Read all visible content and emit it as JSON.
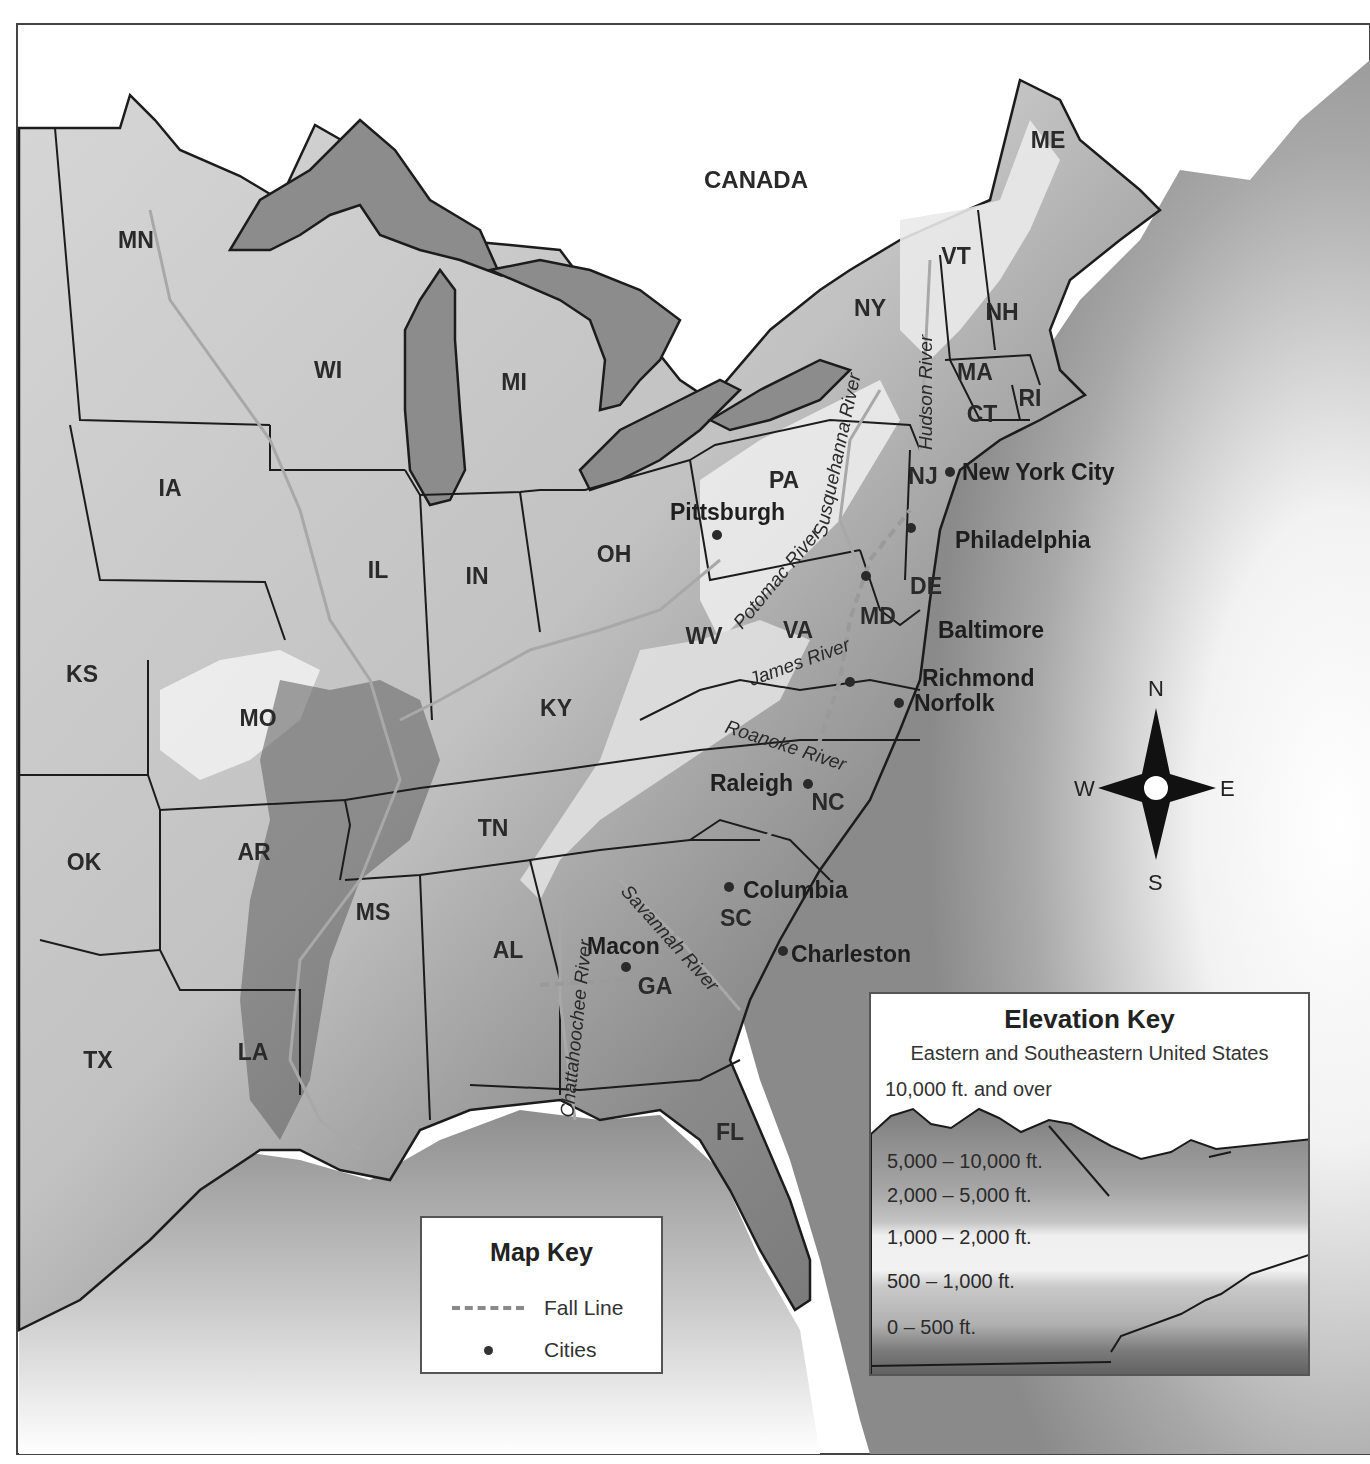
{
  "map": {
    "country_label": "CANADA",
    "states": [
      {
        "abbr": "MN",
        "x": 136,
        "y": 248
      },
      {
        "abbr": "WI",
        "x": 328,
        "y": 378
      },
      {
        "abbr": "MI",
        "x": 514,
        "y": 390
      },
      {
        "abbr": "IA",
        "x": 170,
        "y": 496
      },
      {
        "abbr": "IL",
        "x": 378,
        "y": 578
      },
      {
        "abbr": "IN",
        "x": 477,
        "y": 584
      },
      {
        "abbr": "OH",
        "x": 614,
        "y": 562
      },
      {
        "abbr": "PA",
        "x": 784,
        "y": 488
      },
      {
        "abbr": "NY",
        "x": 870,
        "y": 316
      },
      {
        "abbr": "VT",
        "x": 956,
        "y": 264
      },
      {
        "abbr": "NH",
        "x": 1002,
        "y": 320
      },
      {
        "abbr": "ME",
        "x": 1048,
        "y": 148
      },
      {
        "abbr": "MA",
        "x": 975,
        "y": 380
      },
      {
        "abbr": "CT",
        "x": 982,
        "y": 422
      },
      {
        "abbr": "RI",
        "x": 1030,
        "y": 406
      },
      {
        "abbr": "NJ",
        "x": 923,
        "y": 484
      },
      {
        "abbr": "DE",
        "x": 926,
        "y": 594
      },
      {
        "abbr": "MD",
        "x": 878,
        "y": 624
      },
      {
        "abbr": "WV",
        "x": 704,
        "y": 644
      },
      {
        "abbr": "VA",
        "x": 798,
        "y": 638
      },
      {
        "abbr": "KY",
        "x": 556,
        "y": 716
      },
      {
        "abbr": "KS",
        "x": 82,
        "y": 682
      },
      {
        "abbr": "MO",
        "x": 258,
        "y": 726
      },
      {
        "abbr": "TN",
        "x": 493,
        "y": 836
      },
      {
        "abbr": "NC",
        "x": 828,
        "y": 810
      },
      {
        "abbr": "SC",
        "x": 736,
        "y": 926
      },
      {
        "abbr": "GA",
        "x": 655,
        "y": 994
      },
      {
        "abbr": "AL",
        "x": 508,
        "y": 958
      },
      {
        "abbr": "MS",
        "x": 373,
        "y": 920
      },
      {
        "abbr": "AR",
        "x": 254,
        "y": 860
      },
      {
        "abbr": "OK",
        "x": 84,
        "y": 870
      },
      {
        "abbr": "TX",
        "x": 98,
        "y": 1068
      },
      {
        "abbr": "LA",
        "x": 253,
        "y": 1060
      },
      {
        "abbr": "FL",
        "x": 730,
        "y": 1140
      }
    ],
    "cities": [
      {
        "name": "Pittsburgh",
        "dot_x": 717,
        "dot_y": 535,
        "label_x": 670,
        "label_y": 520
      },
      {
        "name": "New York City",
        "dot_x": 950,
        "dot_y": 472,
        "label_x": 962,
        "label_y": 480
      },
      {
        "name": "Philadelphia",
        "dot_x": 911,
        "dot_y": 528,
        "label_x": 955,
        "label_y": 548
      },
      {
        "name": "Baltimore",
        "dot_x": 866,
        "dot_y": 576,
        "label_x": 938,
        "label_y": 638
      },
      {
        "name": "Richmond",
        "dot_x": 850,
        "dot_y": 682,
        "label_x": 922,
        "label_y": 686
      },
      {
        "name": "Norfolk",
        "dot_x": 899,
        "dot_y": 703,
        "label_x": 914,
        "label_y": 711
      },
      {
        "name": "Raleigh",
        "dot_x": 808,
        "dot_y": 784,
        "label_x": 710,
        "label_y": 791
      },
      {
        "name": "Columbia",
        "dot_x": 729,
        "dot_y": 887,
        "label_x": 743,
        "label_y": 898
      },
      {
        "name": "Charleston",
        "dot_x": 783,
        "dot_y": 951,
        "label_x": 791,
        "label_y": 962
      },
      {
        "name": "Macon",
        "dot_x": 626,
        "dot_y": 967,
        "label_x": 587,
        "label_y": 954
      }
    ],
    "rivers": [
      {
        "name": "Hudson River",
        "x": 932,
        "y": 450,
        "rotate": -90
      },
      {
        "name": "Susquehanna River",
        "x": 826,
        "y": 538,
        "rotate": -78
      },
      {
        "name": "Potomac River",
        "x": 742,
        "y": 630,
        "rotate": -50
      },
      {
        "name": "James River",
        "x": 752,
        "y": 686,
        "rotate": -20
      },
      {
        "name": "Roanoke River",
        "x": 724,
        "y": 732,
        "rotate": 18
      },
      {
        "name": "Savannah River",
        "x": 620,
        "y": 892,
        "rotate": 48
      },
      {
        "name": "Chattahoochee River",
        "x": 573,
        "y": 1118,
        "rotate": -84
      }
    ],
    "compass": {
      "n": "N",
      "s": "S",
      "e": "E",
      "w": "W"
    }
  },
  "map_key": {
    "title": "Map Key",
    "items": [
      {
        "symbol": "dashed-line",
        "label": "Fall Line"
      },
      {
        "symbol": "dot",
        "label": "Cities"
      }
    ]
  },
  "elevation_key": {
    "title": "Elevation Key",
    "subtitle": "Eastern and Southeastern United States",
    "bands": [
      {
        "label": "10,000 ft. and over",
        "color": "#7a7a7a"
      },
      {
        "label": "5,000 – 10,000 ft.",
        "color": "#9a9a9a"
      },
      {
        "label": "2,000 – 5,000 ft.",
        "color": "#b8b8b8"
      },
      {
        "label": "1,000 – 2,000 ft.",
        "color": "#e6e6e6"
      },
      {
        "label": "500 – 1,000 ft.",
        "color": "#bdbdbd"
      },
      {
        "label": "0 – 500 ft.",
        "color": "#707070"
      }
    ]
  },
  "colors": {
    "water": "#8c8c8c",
    "lowland": "#6e6e6e",
    "upland": "#bdbdbd",
    "highland": "#e4e4e4",
    "border": "#1c1c1c",
    "fall_line": "#9a9a9a"
  }
}
